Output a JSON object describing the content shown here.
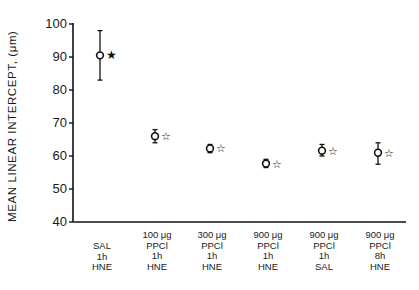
{
  "chart_data": {
    "type": "scatter",
    "title": "",
    "xlabel": "",
    "ylabel": "MEAN LINEAR INTERCEPT, (μm)",
    "ylim": [
      40,
      100
    ],
    "yticks": [
      40,
      50,
      60,
      70,
      80,
      90,
      100
    ],
    "grid": false,
    "legend": null,
    "categories": [
      [
        "SAL",
        "1h",
        "HNE"
      ],
      [
        "100 μg",
        "PPCl",
        "1h",
        "HNE"
      ],
      [
        "300 μg",
        "PPCl",
        "1h",
        "HNE"
      ],
      [
        "900 μg",
        "PPCl",
        "1h",
        "HNE"
      ],
      [
        "900 μg",
        "PPCl",
        "1h",
        "SAL"
      ],
      [
        "900 μg",
        "PPCl",
        "8h",
        "HNE"
      ]
    ],
    "series": [
      {
        "name": "Mean linear intercept",
        "values": [
          90.5,
          66,
          62.3,
          57.7,
          61.6,
          61
        ],
        "error_low": [
          83,
          64,
          61,
          56.5,
          60,
          57.5
        ],
        "error_high": [
          98,
          68,
          63.5,
          59,
          63.5,
          64
        ],
        "markers": "open-circle"
      }
    ],
    "annotations": [
      {
        "index": 0,
        "symbol": "★",
        "style": "filled-star"
      },
      {
        "index": 1,
        "symbol": "☆",
        "style": "open-star"
      },
      {
        "index": 2,
        "symbol": "☆",
        "style": "open-star"
      },
      {
        "index": 3,
        "symbol": "☆",
        "style": "open-star"
      },
      {
        "index": 4,
        "symbol": "☆",
        "style": "open-star"
      },
      {
        "index": 5,
        "symbol": "☆",
        "style": "open-star"
      }
    ]
  },
  "axis": {
    "ylabel": "MEAN LINEAR INTERCEPT, (μm)",
    "yticks": [
      "40",
      "50",
      "60",
      "70",
      "80",
      "90",
      "100"
    ]
  },
  "xlabels": [
    {
      "lines": [
        "SAL",
        "1h",
        "HNE"
      ]
    },
    {
      "lines": [
        "100 μg",
        "PPCl",
        "1h",
        "HNE"
      ]
    },
    {
      "lines": [
        "300 μg",
        "PPCl",
        "1h",
        "HNE"
      ]
    },
    {
      "lines": [
        "900 μg",
        "PPCl",
        "1h",
        "HNE"
      ]
    },
    {
      "lines": [
        "900 μg",
        "PPCl",
        "1h",
        "SAL"
      ]
    },
    {
      "lines": [
        "900 μg",
        "PPCl",
        "8h",
        "HNE"
      ]
    }
  ]
}
